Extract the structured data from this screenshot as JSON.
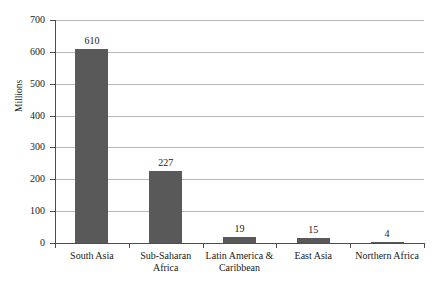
{
  "chart_data": {
    "type": "bar",
    "title": "",
    "xlabel": "",
    "ylabel": "Millions",
    "ylim": [
      0,
      700
    ],
    "ytick_values": [
      0,
      100,
      200,
      300,
      400,
      500,
      600,
      700
    ],
    "ytick_labels": [
      "0",
      "100",
      "200",
      "300",
      "400",
      "500",
      "600",
      "700"
    ],
    "grid": true,
    "legend": "none",
    "categories": [
      "South Asia",
      "Sub-Saharan Africa",
      "Latin America & Caribbean",
      "East Asia",
      "Northern Africa"
    ],
    "category_label_lines": [
      [
        "South Asia"
      ],
      [
        "Sub-Saharan",
        "Africa"
      ],
      [
        "Latin America &",
        "Caribbean"
      ],
      [
        "East Asia"
      ],
      [
        "Northern Africa"
      ]
    ],
    "values": [
      610,
      227,
      19,
      15,
      4
    ],
    "value_labels": [
      "610",
      "227",
      "19",
      "15",
      "4"
    ],
    "bar_color": "#595959",
    "gridline_color": "#b9b9b9",
    "axis_color": "#4d4d4d",
    "background_color": "#ffffff"
  }
}
